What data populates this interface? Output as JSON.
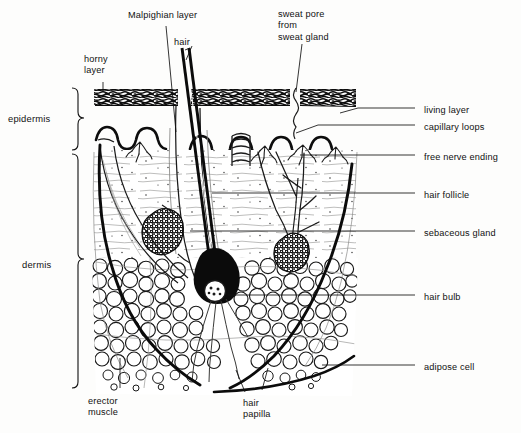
{
  "diagram": {
    "type": "anatomical-cross-section",
    "ink_color": "#101010",
    "paper_color": "#fdfdfc"
  },
  "brackets": [
    {
      "name": "epidermis",
      "label": "epidermis",
      "label_x": 8,
      "label_y": 113,
      "top": 88,
      "bottom": 150,
      "x": 72
    },
    {
      "name": "dermis",
      "label": "dermis",
      "label_x": 22,
      "label_y": 259,
      "top": 152,
      "bottom": 388,
      "x": 72
    }
  ],
  "top_labels": [
    {
      "name": "horny-layer",
      "label": "horny\nlayer",
      "x": 84,
      "y": 54
    },
    {
      "name": "malpighian-layer",
      "label": "Malpighian layer",
      "x": 128,
      "y": 10
    },
    {
      "name": "hair",
      "label": "hair",
      "x": 174,
      "y": 37
    },
    {
      "name": "sweat-pore",
      "label": "sweat pore\nfrom\nsweat gland",
      "x": 278,
      "y": 9
    }
  ],
  "right_labels": [
    {
      "name": "living-layer",
      "label": "living layer",
      "x": 424,
      "y": 105
    },
    {
      "name": "capillary-loops",
      "label": "capillary loops",
      "x": 424,
      "y": 122
    },
    {
      "name": "free-nerve-ending",
      "label": "free nerve ending",
      "x": 424,
      "y": 152
    },
    {
      "name": "hair-follicle",
      "label": "hair follicle",
      "x": 424,
      "y": 190
    },
    {
      "name": "sebaceous-gland",
      "label": "sebaceous gland",
      "x": 424,
      "y": 228
    },
    {
      "name": "hair-bulb",
      "label": "hair bulb",
      "x": 424,
      "y": 292
    },
    {
      "name": "adipose-cell",
      "label": "adipose cell",
      "x": 424,
      "y": 362
    }
  ],
  "bottom_labels": [
    {
      "name": "erector-muscle",
      "label": "erector\nmuscle",
      "x": 88,
      "y": 396
    },
    {
      "name": "hair-papilla",
      "label": "hair\npapilla",
      "x": 243,
      "y": 398
    }
  ],
  "leader_lines": {
    "right_x_start": 415,
    "color": "#101010"
  }
}
